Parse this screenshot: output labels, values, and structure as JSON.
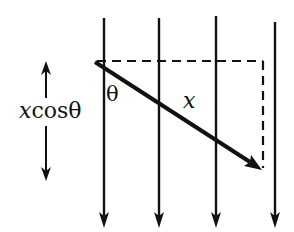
{
  "diagram": {
    "type": "physics-field-displacement",
    "colors": {
      "ink": "#111111",
      "background": "#ffffff"
    },
    "field_lines": [
      {
        "x": 104,
        "y_top": 18,
        "y_bottom": 228,
        "direction": "down"
      },
      {
        "x": 159,
        "y_top": 18,
        "y_bottom": 228,
        "direction": "down"
      },
      {
        "x": 216,
        "y_top": 16,
        "y_bottom": 228,
        "direction": "down"
      },
      {
        "x": 275,
        "y_top": 22,
        "y_bottom": 228,
        "direction": "down"
      }
    ],
    "displacement": {
      "x1": 95,
      "y1": 62,
      "x2": 262,
      "y2": 170,
      "label": "x"
    },
    "dashed_horizontal": {
      "x1": 97,
      "y1": 61,
      "x2": 263,
      "y2": 61
    },
    "dashed_vertical": {
      "x1": 263,
      "y1": 61,
      "x2": 263,
      "y2": 170
    },
    "projection_arrow": {
      "x": 46,
      "y_top": 61,
      "y_bottom": 181
    },
    "labels": {
      "angle": "θ",
      "displacement": "x",
      "projection_var": "x",
      "projection_rest": "cosθ"
    }
  }
}
